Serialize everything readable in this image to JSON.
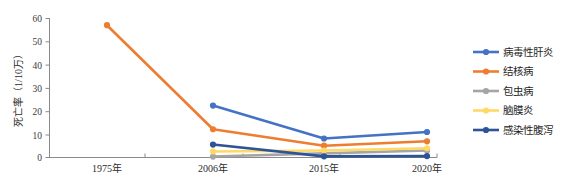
{
  "chart_data": {
    "type": "line",
    "title": "",
    "xlabel": "",
    "ylabel": "死亡率（1/10万）",
    "x": [
      "1975年",
      "2006年",
      "2015年",
      "2020年"
    ],
    "categories": [
      "1975年",
      "2006年",
      "2015年",
      "2020年"
    ],
    "ylim": [
      0,
      60
    ],
    "ytick_labels": [
      "0",
      "10",
      "20",
      "30",
      "40",
      "50",
      "60"
    ],
    "ytick_values": [
      0,
      10,
      20,
      30,
      40,
      50,
      60
    ],
    "grid": false,
    "legend_position": "right",
    "series": [
      {
        "name": "病毒性肝炎",
        "color": "#4472C4",
        "values": [
          null,
          22.4,
          8.2,
          11.0
        ]
      },
      {
        "name": "结核病",
        "color": "#ED7D31",
        "values": [
          57.1,
          12.2,
          5.1,
          7.0
        ]
      },
      {
        "name": "包虫病",
        "color": "#A5A5A5",
        "values": [
          null,
          0.4,
          1.8,
          3.0
        ]
      },
      {
        "name": "脑膜炎",
        "color": "#FFD966",
        "values": [
          null,
          2.6,
          3.0,
          4.0
        ]
      },
      {
        "name": "感染性腹泻",
        "color": "#2E5496",
        "values": [
          null,
          5.6,
          0.5,
          0.6
        ]
      }
    ]
  },
  "axes": {
    "y_axis_title": "死亡率（1/10万）",
    "y_ticks": [
      "60",
      "50",
      "40",
      "30",
      "20",
      "10",
      "0"
    ],
    "x_ticks": [
      "1975年",
      "2006年",
      "2015年",
      "2020年"
    ]
  },
  "legend": {
    "entries": [
      {
        "label": "病毒性肝炎",
        "color": "#4472C4"
      },
      {
        "label": "结核病",
        "color": "#ED7D31"
      },
      {
        "label": "包虫病",
        "color": "#A5A5A5"
      },
      {
        "label": "脑膜炎",
        "color": "#FFD966"
      },
      {
        "label": "感染性腹泻",
        "color": "#2E5496"
      }
    ]
  }
}
